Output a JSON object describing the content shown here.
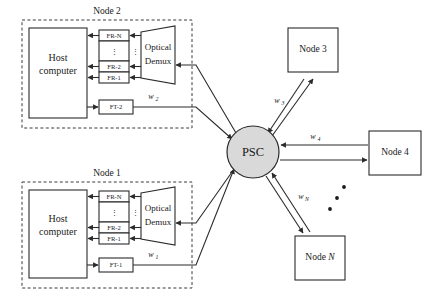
{
  "figure": {
    "type": "network-diagram",
    "hub": {
      "label": "PSC",
      "fill": "#d9d9d9",
      "cx": 253,
      "cy": 152,
      "r": 26
    },
    "access_nodes": [
      {
        "id": "node2",
        "title": "Node 2",
        "host_label_line1": "Host",
        "host_label_line2": "computer",
        "demux_line1": "Optical",
        "demux_line2": "Demux",
        "receivers": [
          "FR-N",
          "FR-2",
          "FR-1"
        ],
        "receiver_gap_dots": "⋮",
        "transmitter": "FT-2",
        "wavelength": "w",
        "wavelength_sub": "2"
      },
      {
        "id": "node1",
        "title": "Node 1",
        "host_label_line1": "Host",
        "host_label_line2": "computer",
        "demux_line1": "Optical",
        "demux_line2": "Demux",
        "receivers": [
          "FR-N",
          "FR-2",
          "FR-1"
        ],
        "receiver_gap_dots": "⋮",
        "transmitter": "FT-1",
        "wavelength": "w",
        "wavelength_sub": "1"
      }
    ],
    "peer_nodes": [
      {
        "id": "node3",
        "label": "Node 3",
        "wavelength": "w",
        "wavelength_sub": "3"
      },
      {
        "id": "node4",
        "label": "Node 4",
        "wavelength": "w",
        "wavelength_sub": "4"
      },
      {
        "id": "nodeN",
        "label_prefix": "Node ",
        "label_suffix": "N",
        "wavelength": "w",
        "wavelength_sub": "N"
      }
    ],
    "ellipsis_dots_count": 3,
    "colors": {
      "stroke": "#2b2b2b",
      "hub_fill": "#d9d9d9",
      "box_fill": "#ffffff",
      "background": "#ffffff"
    }
  }
}
